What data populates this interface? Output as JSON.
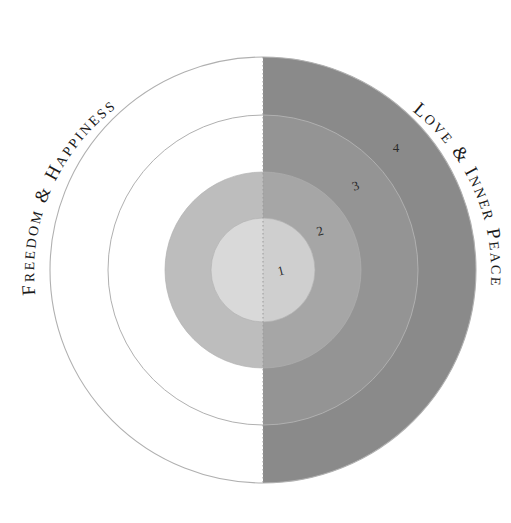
{
  "figure": {
    "title_left": "FREEDOM & HAPPINESS",
    "title_right": "LOVE & INNER PEACE",
    "background_color": "#ffffff"
  },
  "labels": {
    "left_arc": "FREEDOM & HAPPINESS",
    "right_arc": "LOVE & INNER PEACE"
  },
  "chart_data": {
    "type": "pie",
    "title": "",
    "subtitle": "",
    "xlabel": "",
    "ylabel": "",
    "grid": false,
    "legend_position": "none",
    "annotations": [
      {
        "text": "FREEDOM & HAPPINESS",
        "position": "outer-left-arc"
      },
      {
        "text": "LOVE & INNER PEACE",
        "position": "outer-right-arc"
      }
    ],
    "categories": [
      "1",
      "2",
      "3",
      "4"
    ],
    "values": [
      1,
      2,
      3,
      4
    ],
    "series": [
      {
        "name": "concentric rings",
        "values": [
          1,
          2,
          3,
          4
        ]
      }
    ],
    "rings": [
      {
        "index": 1,
        "label": "1",
        "radius_px": 52,
        "left_fill": "#d9d9d9",
        "right_fill": "#cfcfcf",
        "label_x": 282,
        "label_y": 275
      },
      {
        "index": 2,
        "label": "2",
        "radius_px": 98,
        "left_fill": "#bdbdbd",
        "right_fill": "#a6a6a6",
        "label_x": 321,
        "label_y": 235
      },
      {
        "index": 3,
        "label": "3",
        "radius_px": 155,
        "left_fill": "#ffffff",
        "right_fill": "#949494",
        "label_x": 357,
        "label_y": 190
      },
      {
        "index": 4,
        "label": "4",
        "radius_px": 213,
        "left_fill": "#ffffff",
        "right_fill": "#8a8a8a",
        "label_x": 396,
        "label_y": 152
      }
    ],
    "center": {
      "x": 263,
      "y": 270
    },
    "divider": {
      "style": "dotted",
      "orientation": "vertical",
      "color": "#9a9a9a"
    },
    "outline_color": "#b0b0b0"
  }
}
